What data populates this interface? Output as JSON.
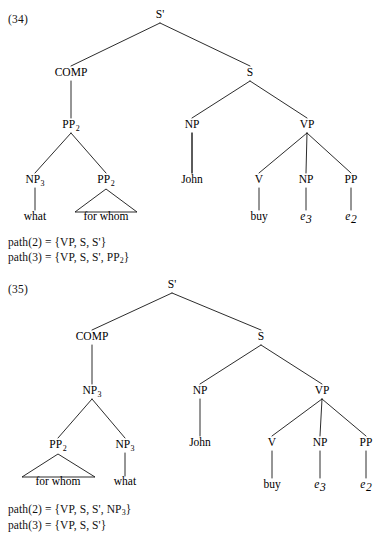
{
  "page": {
    "background": "#ffffff",
    "ink": "#111111",
    "width": 391,
    "height": 543
  },
  "examples": [
    {
      "id": "34",
      "number_label": "(34)",
      "number_pos": {
        "x": 8,
        "y": 13
      },
      "tree": {
        "nodes": [
          {
            "key": "sbar",
            "label": "S'",
            "sub": "",
            "x": 160,
            "y": 18,
            "italic": false
          },
          {
            "key": "comp",
            "label": "COMP",
            "sub": "",
            "x": 71,
            "y": 76,
            "italic": false
          },
          {
            "key": "s",
            "label": "S",
            "sub": "",
            "x": 250,
            "y": 76,
            "italic": false
          },
          {
            "key": "pp2-top",
            "label": "PP",
            "sub": "2",
            "x": 71,
            "y": 128,
            "italic": false
          },
          {
            "key": "np-subj",
            "label": "NP",
            "sub": "",
            "x": 192,
            "y": 128,
            "italic": false
          },
          {
            "key": "vp",
            "label": "VP",
            "sub": "",
            "x": 307,
            "y": 128,
            "italic": false
          },
          {
            "key": "np3",
            "label": "NP",
            "sub": "3",
            "x": 35,
            "y": 183,
            "italic": false
          },
          {
            "key": "pp2-low",
            "label": "PP",
            "sub": "2",
            "x": 106,
            "y": 183,
            "italic": false
          },
          {
            "key": "v",
            "label": "V",
            "sub": "",
            "x": 259,
            "y": 183,
            "italic": false
          },
          {
            "key": "np-obj",
            "label": "NP",
            "sub": "",
            "x": 306,
            "y": 183,
            "italic": false
          },
          {
            "key": "pp-obj",
            "label": "PP",
            "sub": "",
            "x": 351,
            "y": 183,
            "italic": false
          }
        ],
        "leaves": [
          {
            "key": "leaf-what",
            "label": "what",
            "sub": "",
            "x": 35,
            "y": 220,
            "italic": false
          },
          {
            "key": "leaf-forwhom",
            "label": "for whom",
            "sub": "",
            "x": 106,
            "y": 220,
            "italic": false
          },
          {
            "key": "leaf-john",
            "label": "John",
            "sub": "",
            "x": 192,
            "y": 183,
            "italic": false
          },
          {
            "key": "leaf-buy",
            "label": "buy",
            "sub": "",
            "x": 259,
            "y": 220,
            "italic": false
          },
          {
            "key": "leaf-e3",
            "label": "e",
            "sub": "3",
            "x": 306,
            "y": 220,
            "italic": true
          },
          {
            "key": "leaf-e2",
            "label": "e",
            "sub": "2",
            "x": 351,
            "y": 220,
            "italic": true
          }
        ],
        "edges": [
          {
            "x1": 160,
            "y1": 23,
            "x2": 71,
            "y2": 66
          },
          {
            "x1": 160,
            "y1": 23,
            "x2": 250,
            "y2": 66
          },
          {
            "x1": 71,
            "y1": 81,
            "x2": 71,
            "y2": 118
          },
          {
            "x1": 250,
            "y1": 81,
            "x2": 192,
            "y2": 118
          },
          {
            "x1": 250,
            "y1": 81,
            "x2": 307,
            "y2": 118
          },
          {
            "x1": 71,
            "y1": 133,
            "x2": 35,
            "y2": 173
          },
          {
            "x1": 71,
            "y1": 133,
            "x2": 106,
            "y2": 173
          },
          {
            "x1": 192,
            "y1": 133,
            "x2": 192,
            "y2": 173
          },
          {
            "x1": 307,
            "y1": 133,
            "x2": 259,
            "y2": 173
          },
          {
            "x1": 307,
            "y1": 133,
            "x2": 306,
            "y2": 173
          },
          {
            "x1": 307,
            "y1": 133,
            "x2": 351,
            "y2": 173
          },
          {
            "x1": 35,
            "y1": 188,
            "x2": 35,
            "y2": 210
          },
          {
            "x1": 192,
            "y1": 133,
            "x2": 192,
            "y2": 173
          },
          {
            "x1": 259,
            "y1": 188,
            "x2": 259,
            "y2": 210
          },
          {
            "x1": 306,
            "y1": 188,
            "x2": 306,
            "y2": 210
          },
          {
            "x1": 351,
            "y1": 188,
            "x2": 351,
            "y2": 210
          }
        ],
        "triangles": [
          {
            "key": "triangle-for-whom",
            "apex_x": 106,
            "apex_y": 189,
            "left_x": 75,
            "right_x": 137,
            "base_y": 212
          }
        ]
      },
      "paths": [
        {
          "key": "path-2",
          "prefix": "path(2) = {VP, S, S",
          "suffix": "}",
          "items": [
            "VP",
            "S",
            "S'"
          ],
          "text": "path(2) = {VP, S, S'}",
          "x": 8,
          "y": 236
        },
        {
          "key": "path-3",
          "prefix": "path(3) = {VP, S, S",
          "suffix": "}",
          "items": [
            "VP",
            "S",
            "S'",
            "PP2"
          ],
          "text": "path(3) = {VP, S, S', PP2}",
          "x": 8,
          "y": 251
        }
      ]
    },
    {
      "id": "35",
      "number_label": "(35)",
      "number_pos": {
        "x": 8,
        "y": 283
      },
      "tree": {
        "nodes": [
          {
            "key": "sbar",
            "label": "S'",
            "sub": "",
            "x": 172,
            "y": 288,
            "italic": false
          },
          {
            "key": "comp",
            "label": "COMP",
            "sub": "",
            "x": 92,
            "y": 340,
            "italic": false
          },
          {
            "key": "s",
            "label": "S",
            "sub": "",
            "x": 261,
            "y": 340,
            "italic": false
          },
          {
            "key": "np3-top",
            "label": "NP",
            "sub": "3",
            "x": 92,
            "y": 394,
            "italic": false
          },
          {
            "key": "np-subj",
            "label": "NP",
            "sub": "",
            "x": 200,
            "y": 394,
            "italic": false
          },
          {
            "key": "vp",
            "label": "VP",
            "sub": "",
            "x": 322,
            "y": 394,
            "italic": false
          },
          {
            "key": "pp2-low",
            "label": "PP",
            "sub": "2",
            "x": 58,
            "y": 448,
            "italic": false
          },
          {
            "key": "np3-low",
            "label": "NP",
            "sub": "3",
            "x": 125,
            "y": 448,
            "italic": false
          },
          {
            "key": "v",
            "label": "V",
            "sub": "",
            "x": 272,
            "y": 446,
            "italic": false
          },
          {
            "key": "np-obj",
            "label": "NP",
            "sub": "",
            "x": 320,
            "y": 446,
            "italic": false
          },
          {
            "key": "pp-obj",
            "label": "PP",
            "sub": "",
            "x": 366,
            "y": 446,
            "italic": false
          }
        ],
        "leaves": [
          {
            "key": "leaf-forwhom",
            "label": "for whom",
            "sub": "",
            "x": 58,
            "y": 485,
            "italic": false
          },
          {
            "key": "leaf-what",
            "label": "what",
            "sub": "",
            "x": 125,
            "y": 485,
            "italic": false
          },
          {
            "key": "leaf-john",
            "label": "John",
            "sub": "",
            "x": 200,
            "y": 446,
            "italic": false
          },
          {
            "key": "leaf-buy",
            "label": "buy",
            "sub": "",
            "x": 272,
            "y": 488,
            "italic": false
          },
          {
            "key": "leaf-e3",
            "label": "e",
            "sub": "3",
            "x": 320,
            "y": 488,
            "italic": true
          },
          {
            "key": "leaf-e2",
            "label": "e",
            "sub": "2",
            "x": 366,
            "y": 488,
            "italic": true
          }
        ],
        "edges": [
          {
            "x1": 172,
            "y1": 293,
            "x2": 92,
            "y2": 330
          },
          {
            "x1": 172,
            "y1": 293,
            "x2": 261,
            "y2": 330
          },
          {
            "x1": 92,
            "y1": 345,
            "x2": 92,
            "y2": 384
          },
          {
            "x1": 261,
            "y1": 345,
            "x2": 200,
            "y2": 384
          },
          {
            "x1": 261,
            "y1": 345,
            "x2": 322,
            "y2": 384
          },
          {
            "x1": 92,
            "y1": 399,
            "x2": 58,
            "y2": 438
          },
          {
            "x1": 92,
            "y1": 399,
            "x2": 125,
            "y2": 438
          },
          {
            "x1": 200,
            "y1": 399,
            "x2": 200,
            "y2": 436
          },
          {
            "x1": 322,
            "y1": 399,
            "x2": 272,
            "y2": 436
          },
          {
            "x1": 322,
            "y1": 399,
            "x2": 320,
            "y2": 436
          },
          {
            "x1": 322,
            "y1": 399,
            "x2": 366,
            "y2": 436
          },
          {
            "x1": 125,
            "y1": 453,
            "x2": 125,
            "y2": 476
          },
          {
            "x1": 272,
            "y1": 451,
            "x2": 272,
            "y2": 478
          },
          {
            "x1": 320,
            "y1": 451,
            "x2": 320,
            "y2": 478
          },
          {
            "x1": 366,
            "y1": 451,
            "x2": 366,
            "y2": 478
          }
        ],
        "triangles": [
          {
            "key": "triangle-for-whom",
            "apex_x": 58,
            "apex_y": 454,
            "left_x": 22,
            "right_x": 95,
            "base_y": 477
          }
        ]
      },
      "paths": [
        {
          "key": "path-2",
          "prefix": "path(2) = {VP, S, S",
          "suffix": "}",
          "items": [
            "VP",
            "S",
            "S'",
            "NP3"
          ],
          "text": "path(2) = {VP, S, S', NP3}",
          "x": 8,
          "y": 503
        },
        {
          "key": "path-3",
          "prefix": "path(3) = {VP, S, S",
          "suffix": "}",
          "items": [
            "VP",
            "S",
            "S'"
          ],
          "text": "path(3) = {VP, S, S'}",
          "x": 8,
          "y": 519
        }
      ]
    }
  ]
}
